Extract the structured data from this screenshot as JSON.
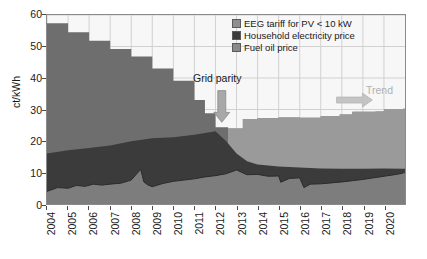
{
  "chart_data": {
    "type": "area",
    "title": "",
    "xlabel": "",
    "ylabel": "ct/kWh",
    "ylim": [
      0,
      60
    ],
    "ytickstep": 10,
    "yticks": [
      0,
      10,
      20,
      30,
      40,
      50,
      60
    ],
    "xlim": [
      2004,
      2021
    ],
    "categories": [
      "2004",
      "2005",
      "2006",
      "2007",
      "2008",
      "2009",
      "2010",
      "2011",
      "2012",
      "2013",
      "2014",
      "2015",
      "2016",
      "2017",
      "2018",
      "2019",
      "2020"
    ],
    "grid": true,
    "legend_position": "top-right",
    "stacked": false,
    "series": [
      {
        "name": "EEG tariff for PV < 10 kW",
        "color": "#6e6e6e",
        "style": "step",
        "x": [
          2004.0,
          2004.5,
          2005.0,
          2005.5,
          2006.0,
          2006.5,
          2007.0,
          2007.5,
          2008.0,
          2008.5,
          2009.0,
          2009.5,
          2010.0,
          2010.5,
          2011.0,
          2011.5,
          2012.0,
          2012.35,
          2012.6,
          2013.0,
          2013.3,
          2014.0,
          2015.0,
          2016.0,
          2017.0,
          2017.9,
          2018.5,
          2019.6,
          2020.0,
          2020.9
        ],
        "values": [
          57.4,
          57.4,
          54.5,
          54.5,
          51.8,
          51.8,
          49.2,
          49.2,
          46.8,
          46.8,
          43.0,
          43.0,
          39.1,
          39.1,
          33.0,
          28.8,
          24.4,
          24.4,
          24.0,
          24.0,
          27.0,
          27.2,
          27.5,
          27.4,
          27.9,
          28.4,
          29.3,
          29.4,
          30.0,
          30.2
        ]
      },
      {
        "name": "Household electricity price",
        "color": "#3b3b3b",
        "style": "line-upper",
        "x": [
          2004,
          2005,
          2006,
          2007,
          2008,
          2009,
          2010,
          2011,
          2012,
          2012.5,
          2013,
          2013.5,
          2014,
          2015,
          2016,
          2017,
          2018,
          2019,
          2020,
          2020.9
        ],
        "values": [
          16.0,
          17.1,
          17.8,
          18.6,
          19.9,
          20.9,
          21.2,
          22.0,
          23.1,
          20.0,
          16.0,
          13.6,
          12.5,
          11.9,
          11.6,
          11.3,
          11.2,
          11.2,
          11.3,
          11.2
        ]
      },
      {
        "name": "Fuel oil price",
        "color": "#7d7d7d",
        "style": "line-lower",
        "x": [
          2004,
          2004.5,
          2005,
          2005.4,
          2005.8,
          2006.2,
          2006.6,
          2007,
          2007.5,
          2008,
          2008.45,
          2008.6,
          2008.8,
          2009,
          2009.5,
          2010,
          2010.5,
          2011,
          2011.5,
          2012,
          2012.5,
          2013,
          2013.5,
          2014,
          2014.5,
          2015,
          2015.1,
          2015.5,
          2016,
          2016.2,
          2016.5,
          2017,
          2017.5,
          2018,
          2018.5,
          2019,
          2019.5,
          2020,
          2020.5,
          2020.9
        ],
        "values": [
          4.0,
          5.2,
          5.0,
          5.9,
          5.6,
          6.3,
          6.0,
          6.3,
          6.6,
          7.6,
          11.0,
          7.0,
          6.0,
          5.5,
          6.5,
          7.2,
          7.6,
          8.0,
          8.6,
          9.0,
          9.6,
          10.8,
          9.3,
          9.4,
          8.8,
          8.9,
          6.9,
          8.1,
          8.3,
          5.2,
          6.3,
          6.4,
          6.7,
          7.0,
          7.4,
          7.8,
          8.3,
          8.8,
          9.3,
          9.8
        ]
      }
    ],
    "annotations": [
      {
        "name": "grid-parity",
        "text": "Grid parity",
        "x": 2012.3,
        "y": 36,
        "arrow": "down",
        "color": "#1a1a1a"
      },
      {
        "name": "trend",
        "text": "Trend",
        "x": 2018.6,
        "y": 33,
        "arrow": "right",
        "color": "#b0b0b0"
      }
    ]
  },
  "axes": {
    "y_title": "ct/kWh",
    "y_labels": [
      "0",
      "10",
      "20",
      "30",
      "40",
      "50",
      "60"
    ],
    "x_labels": [
      "2004",
      "2005",
      "2006",
      "2007",
      "2008",
      "2009",
      "2010",
      "2011",
      "2012",
      "2013",
      "2014",
      "2015",
      "2016",
      "2017",
      "2018",
      "2019",
      "2020"
    ]
  },
  "legend": {
    "items": [
      {
        "label": "EEG tariff for PV < 10 kW",
        "color": "#8f8f8f"
      },
      {
        "label": "Household electricity price",
        "color": "#3b3b3b"
      },
      {
        "label": "Fuel oil price",
        "color": "#8a8a8a"
      }
    ]
  },
  "annotations": {
    "grid_parity_label": "Grid parity",
    "trend_label": "Trend"
  },
  "colors": {
    "eeg_early": "#6e6e6e",
    "eeg_late": "#9a9a9a",
    "household": "#3b3b3b",
    "fuel_oil": "#7d7d7d",
    "plot_bg": "#f7f7f7",
    "grid": "#d0d0d0",
    "frame": "#8a8a8a",
    "trend_gray": "#b0b0b0"
  }
}
